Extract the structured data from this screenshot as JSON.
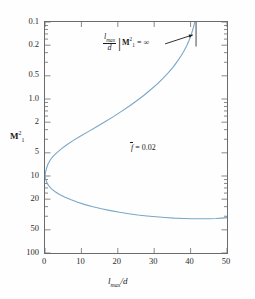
{
  "chart_data": {
    "type": "line",
    "title": "",
    "xlabel": "l_max/d",
    "ylabel": "M_1^2",
    "xlim": [
      0,
      50
    ],
    "ylim": [
      0.1,
      100
    ],
    "yscale": "log",
    "xscale": "linear",
    "grid": false,
    "legend": null,
    "xticks": [
      "0",
      "10",
      "20",
      "30",
      "40",
      "50"
    ],
    "xtick_values": [
      0,
      10,
      20,
      30,
      40,
      50
    ],
    "yticks": [
      "0.1",
      "0.2",
      "0.5",
      "1.0",
      "2",
      "5",
      "10",
      "20",
      "50",
      "100"
    ],
    "ytick_values": [
      0.1,
      0.2,
      0.5,
      1.0,
      2,
      5,
      10,
      20,
      50,
      100
    ],
    "curve_color": "#7aa7c7",
    "axis_color": "#6b6b6b",
    "series": [
      {
        "name": "supersonic-branch",
        "comment": "upper branch: M1^2 > 1, rises from (0,1) to vertical asymptote near l_max/d = 41.5",
        "points": [
          [
            0.0,
            1.0
          ],
          [
            0.15,
            1.12
          ],
          [
            0.4,
            1.25
          ],
          [
            0.8,
            1.42
          ],
          [
            1.4,
            1.6
          ],
          [
            2.2,
            1.8
          ],
          [
            3.2,
            2.0
          ],
          [
            4.5,
            2.25
          ],
          [
            6.0,
            2.55
          ],
          [
            7.8,
            2.9
          ],
          [
            9.8,
            3.3
          ],
          [
            12.0,
            3.8
          ],
          [
            14.3,
            4.4
          ],
          [
            16.6,
            5.1
          ],
          [
            18.8,
            5.9
          ],
          [
            21.0,
            6.9
          ],
          [
            23.2,
            8.1
          ],
          [
            25.2,
            9.5
          ],
          [
            27.2,
            11.2
          ],
          [
            29.0,
            13.2
          ],
          [
            30.8,
            15.6
          ],
          [
            32.4,
            18.5
          ],
          [
            33.9,
            22.0
          ],
          [
            35.2,
            26.0
          ],
          [
            36.4,
            31.0
          ],
          [
            37.4,
            36.5
          ],
          [
            38.3,
            43.0
          ],
          [
            39.0,
            50.0
          ],
          [
            39.6,
            58.0
          ],
          [
            40.1,
            67.0
          ],
          [
            40.5,
            77.0
          ],
          [
            40.8,
            86.0
          ],
          [
            41.0,
            94.0
          ],
          [
            41.15,
            100.0
          ]
        ]
      },
      {
        "name": "subsonic-branch",
        "comment": "lower branch: M1^2 < 1, falls from (0,1) toward ~0.28 plateau then slight rise at x=50",
        "points": [
          [
            0.0,
            1.0
          ],
          [
            0.2,
            0.9
          ],
          [
            0.5,
            0.82
          ],
          [
            1.0,
            0.75
          ],
          [
            1.8,
            0.68
          ],
          [
            2.8,
            0.625
          ],
          [
            4.0,
            0.575
          ],
          [
            5.5,
            0.53
          ],
          [
            7.2,
            0.49
          ],
          [
            9.0,
            0.455
          ],
          [
            11.0,
            0.425
          ],
          [
            13.2,
            0.398
          ],
          [
            15.5,
            0.375
          ],
          [
            18.0,
            0.355
          ],
          [
            20.5,
            0.338
          ],
          [
            23.0,
            0.324
          ],
          [
            25.5,
            0.312
          ],
          [
            28.0,
            0.303
          ],
          [
            30.5,
            0.295
          ],
          [
            33.0,
            0.289
          ],
          [
            35.5,
            0.284
          ],
          [
            38.0,
            0.281
          ],
          [
            40.5,
            0.279
          ],
          [
            43.0,
            0.278
          ],
          [
            45.0,
            0.279
          ],
          [
            47.0,
            0.281
          ],
          [
            48.5,
            0.284
          ],
          [
            50.0,
            0.288
          ]
        ]
      }
    ],
    "annotations": [
      {
        "name": "asymptote-label",
        "text_numerator": "l",
        "text_numerator_sub": "max",
        "text_denominator": "d",
        "bar": "|",
        "condition_base": "M",
        "condition_sup": "2",
        "condition_sub": "1",
        "condition_rest": "= ∞"
      },
      {
        "name": "friction-parameter",
        "symbol": "f",
        "overbar": true,
        "equals": "= 0.02"
      }
    ],
    "asymptote_line": {
      "x": 41.5,
      "y_from": 100,
      "y_to": 48
    },
    "pointer_arrow": {
      "from": [
        33.0,
        52
      ],
      "to": [
        40.6,
        68
      ]
    }
  },
  "axes": {
    "y_title": {
      "base": "M",
      "sup": "2",
      "sub": "1"
    },
    "x_title": {
      "base": "l",
      "sub": "max",
      "rest": "/d"
    }
  },
  "labels": {
    "y": [
      "100",
      "50",
      "20",
      "10",
      "5",
      "2",
      "1.0",
      "0.5",
      "0.2",
      "0.1"
    ],
    "x": [
      "0",
      "10",
      "20",
      "30",
      "40",
      "50"
    ]
  },
  "annot": {
    "fbar_eq": "= 0.02",
    "fbar_sym": "f",
    "inf_eq": "= ∞",
    "lmax": "l",
    "lmax_sub": "max",
    "d": "d"
  }
}
